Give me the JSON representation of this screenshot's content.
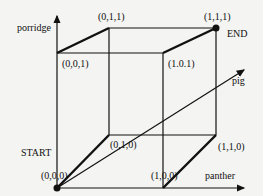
{
  "diagram": {
    "type": "3d-cube-state-space",
    "axes": {
      "x": {
        "label": "panther"
      },
      "y": {
        "label": "pig"
      },
      "z": {
        "label": "porridge"
      }
    },
    "vertices": [
      {
        "id": "v000",
        "label": "(0,0,0)"
      },
      {
        "id": "v100",
        "label": "(1,0,0)"
      },
      {
        "id": "v010",
        "label": "(0,1,0)"
      },
      {
        "id": "v110",
        "label": "(1,1,0)"
      },
      {
        "id": "v001",
        "label": "(0,0,1)"
      },
      {
        "id": "v101",
        "label": "(1.0.1)"
      },
      {
        "id": "v011",
        "label": "(0,1,1)"
      },
      {
        "id": "v111",
        "label": "(1,1,1)"
      }
    ],
    "start_label": "START",
    "end_label": "END",
    "colors": {
      "line": "#111111",
      "background": "#f4f4f2"
    }
  }
}
